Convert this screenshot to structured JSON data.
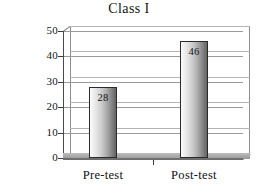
{
  "chart_data": {
    "type": "bar",
    "title": "Class I",
    "xlabel": "",
    "ylabel": "Percent Correct",
    "categories": [
      "Pre-test",
      "Post-test"
    ],
    "values": [
      28,
      46
    ],
    "value_labels": [
      "28",
      "46"
    ],
    "ylim": [
      0,
      50
    ],
    "yticks": [
      0,
      10,
      20,
      30,
      40,
      50
    ],
    "ytick_labels": [
      "0",
      "10",
      "20",
      "30",
      "40",
      "50"
    ],
    "grid": "horizontal",
    "legend": "none",
    "series": [
      {
        "name": "Percent Correct",
        "values": [
          28,
          46
        ]
      }
    ],
    "style": {
      "bar_fill": "#c8c8c8",
      "bar_edge": "#2b2b2b",
      "gridline_color": "#9a9a9a",
      "axis_color": "#4a4a4a",
      "background": "#ffffff",
      "floor_color": "#aaaaaa"
    }
  }
}
